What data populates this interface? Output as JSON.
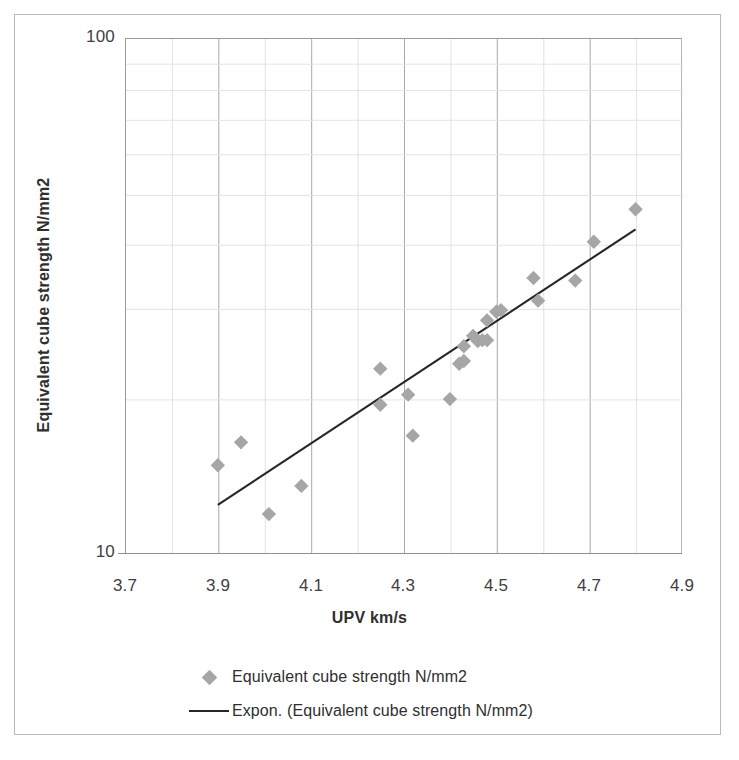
{
  "chart_data": {
    "type": "scatter",
    "title": "",
    "xlabel": "UPV km/s",
    "ylabel": "Equivalent cube strength N/mm2",
    "xlim": [
      3.7,
      4.9
    ],
    "ylim": [
      10,
      100
    ],
    "yscale": "log",
    "xticks": [
      "3.7",
      "3.9",
      "4.1",
      "4.3",
      "4.5",
      "4.7",
      "4.9"
    ],
    "xtick_values": [
      3.7,
      3.9,
      4.1,
      4.3,
      4.5,
      4.7,
      4.9
    ],
    "yticks": [
      "10",
      "100"
    ],
    "ytick_values": [
      10,
      100
    ],
    "y_minor_gridlines": [
      20,
      30,
      40,
      50,
      60,
      70,
      80,
      90
    ],
    "grid": "both",
    "legend_position": "bottom",
    "marker": "diamond",
    "marker_color": "#a6a6a6",
    "line_color": "#262626",
    "series": [
      {
        "name": "Equivalent cube strength N/mm2",
        "type": "scatter",
        "x": [
          3.9,
          3.95,
          4.01,
          4.08,
          4.25,
          4.25,
          4.31,
          4.32,
          4.4,
          4.42,
          4.43,
          4.43,
          4.45,
          4.46,
          4.47,
          4.48,
          4.48,
          4.5,
          4.51,
          4.58,
          4.59,
          4.67,
          4.71,
          4.8
        ],
        "y": [
          14.8,
          16.4,
          11.9,
          13.5,
          19.4,
          22.8,
          20.3,
          16.9,
          19.9,
          23.3,
          23.6,
          25.2,
          26.4,
          25.8,
          25.9,
          28.3,
          25.9,
          29.4,
          29.6,
          34.2,
          30.9,
          33.8,
          40.2,
          46.5
        ]
      },
      {
        "name": "Expon. (Equivalent cube strength N/mm2)",
        "type": "line",
        "fit": "exponential",
        "x": [
          3.9,
          4.8
        ],
        "y": [
          12.4,
          42.5
        ]
      }
    ]
  },
  "legend": {
    "items": [
      {
        "label": "Equivalent cube strength  N/mm2",
        "key": "diamond-marker"
      },
      {
        "label": "Expon. (Equivalent cube strength N/mm2)",
        "key": "line-marker"
      }
    ]
  }
}
